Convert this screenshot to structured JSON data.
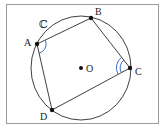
{
  "diagram": {
    "circle_label": "ℂ",
    "center_label": "O",
    "vertices": [
      {
        "id": "A",
        "label": "A"
      },
      {
        "id": "B",
        "label": "B"
      },
      {
        "id": "C",
        "label": "C"
      },
      {
        "id": "D",
        "label": "D"
      }
    ],
    "angle_marks": [
      {
        "vertex": "A",
        "arcs": 1
      },
      {
        "vertex": "C",
        "arcs": 2
      }
    ],
    "colors": {
      "stroke": "#2a2a2a",
      "angle_mark": "#3a6bc4",
      "frame": "#9a9a9a"
    }
  }
}
